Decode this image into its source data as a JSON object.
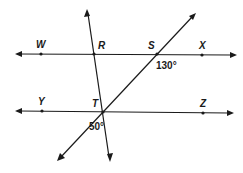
{
  "diagram": {
    "type": "geometry-lines-transversals",
    "lines": [
      {
        "name": "line-WX",
        "through": [
          "W",
          "R",
          "S",
          "X"
        ]
      },
      {
        "name": "line-YZ",
        "through": [
          "Y",
          "T",
          "Z"
        ]
      },
      {
        "name": "line-RT",
        "through": [
          "R",
          "T"
        ]
      },
      {
        "name": "line-ST",
        "through": [
          "S",
          "T"
        ]
      }
    ],
    "points": {
      "W": {
        "label": "W"
      },
      "R": {
        "label": "R"
      },
      "S": {
        "label": "S"
      },
      "X": {
        "label": "X"
      },
      "Y": {
        "label": "Y"
      },
      "T": {
        "label": "T"
      },
      "Z": {
        "label": "Z"
      }
    },
    "angles": {
      "at_S": {
        "label": "130°",
        "vertex": "S"
      },
      "at_T": {
        "label": "50°",
        "vertex": "T"
      }
    }
  }
}
